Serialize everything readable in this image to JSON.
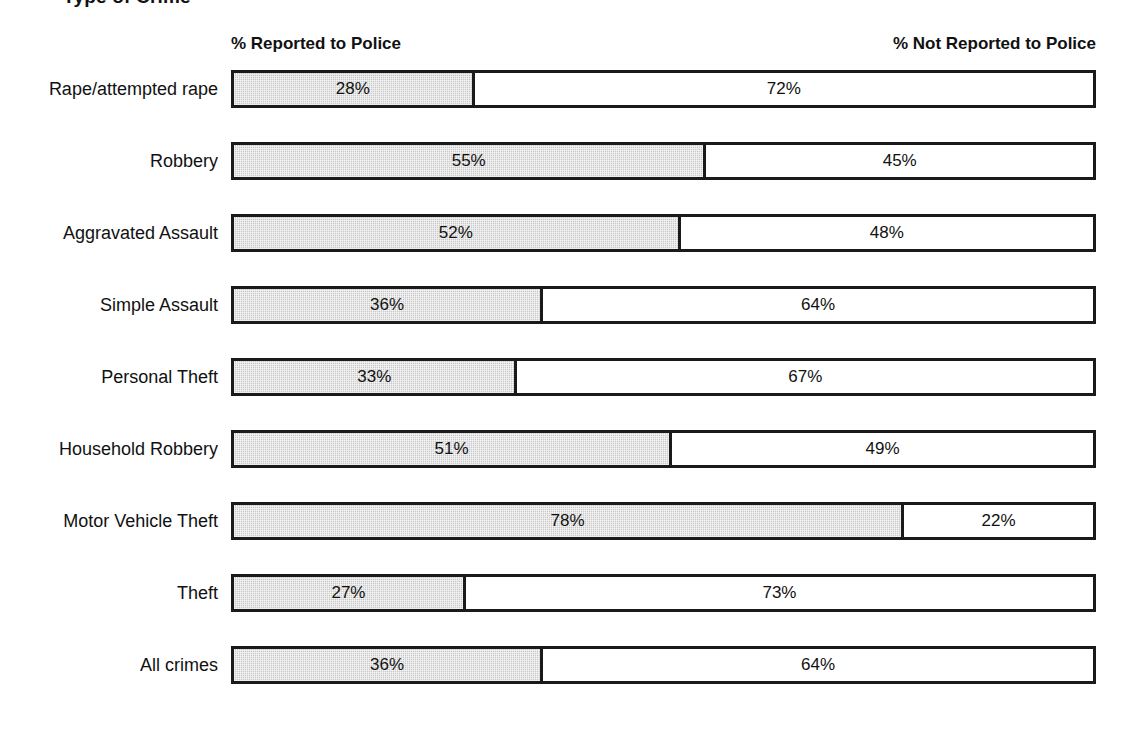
{
  "chart": {
    "title": "Type of Crime",
    "headers": {
      "left": "% Reported to Police",
      "right": "% Not Reported to Police"
    }
  },
  "chart_data": {
    "type": "bar",
    "orientation": "horizontal",
    "stacked": true,
    "normalized_to": 100,
    "title": "Type of Crime",
    "xlabel": "",
    "ylabel": "Type of Crime",
    "xlim": [
      0,
      100
    ],
    "grid": false,
    "legend_position": "top",
    "categories": [
      "Rape/attempted rape",
      "Robbery",
      "Aggravated Assault",
      "Simple Assault",
      "Personal Theft",
      "Household Robbery",
      "Motor Vehicle Theft",
      "Theft",
      "All crimes"
    ],
    "series": [
      {
        "name": "% Reported to Police",
        "color": "#c9c9c9",
        "values": [
          28,
          55,
          52,
          36,
          33,
          51,
          78,
          27,
          36
        ],
        "labels": [
          "28%",
          "55%",
          "52%",
          "36%",
          "33%",
          "51%",
          "78%",
          "27%",
          "36%"
        ]
      },
      {
        "name": "% Not Reported to Police",
        "color": "#ffffff",
        "values": [
          72,
          45,
          48,
          64,
          67,
          49,
          22,
          73,
          64
        ],
        "labels": [
          "72%",
          "45%",
          "48%",
          "64%",
          "67%",
          "49%",
          "22%",
          "73%",
          "64%"
        ]
      }
    ],
    "rows": [
      {
        "label": "Rape/attempted rape",
        "reported": 28,
        "reported_label": "28%",
        "not_reported": 72,
        "not_reported_label": "72%"
      },
      {
        "label": "Robbery",
        "reported": 55,
        "reported_label": "55%",
        "not_reported": 45,
        "not_reported_label": "45%"
      },
      {
        "label": "Aggravated Assault",
        "reported": 52,
        "reported_label": "52%",
        "not_reported": 48,
        "not_reported_label": "48%"
      },
      {
        "label": "Simple Assault",
        "reported": 36,
        "reported_label": "36%",
        "not_reported": 64,
        "not_reported_label": "64%"
      },
      {
        "label": "Personal Theft",
        "reported": 33,
        "reported_label": "33%",
        "not_reported": 67,
        "not_reported_label": "67%"
      },
      {
        "label": "Household Robbery",
        "reported": 51,
        "reported_label": "51%",
        "not_reported": 49,
        "not_reported_label": "49%"
      },
      {
        "label": "Motor Vehicle Theft",
        "reported": 78,
        "reported_label": "78%",
        "not_reported": 22,
        "not_reported_label": "22%"
      },
      {
        "label": "Theft",
        "reported": 27,
        "reported_label": "27%",
        "not_reported": 73,
        "not_reported_label": "73%"
      },
      {
        "label": "All crimes",
        "reported": 36,
        "reported_label": "36%",
        "not_reported": 64,
        "not_reported_label": "64%"
      }
    ],
    "colors": {
      "reported_fill": "#c9c9c9",
      "not_reported_fill": "#ffffff",
      "bar_outline": "#1a1a1a",
      "text": "#111111",
      "background": "#ffffff"
    }
  }
}
